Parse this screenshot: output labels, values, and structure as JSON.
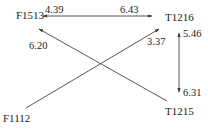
{
  "nodes": {
    "f1513": "F1513",
    "t1216": "T1216",
    "f1112": "F1112",
    "t1215": "T1215"
  },
  "edges": {
    "f1513_t1216": {
      "near_f1513": "4.39",
      "near_t1216": "6.43"
    },
    "t1215_f1513": {
      "value": "6.20"
    },
    "f1112_t1216": {
      "value": "3.37"
    },
    "t1216_t1215": {
      "near_t1216": "5.46",
      "near_t1215": "6.31"
    }
  }
}
